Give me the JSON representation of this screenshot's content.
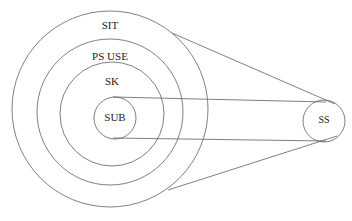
{
  "diagram": {
    "background_color": "#ffffff",
    "stroke_color": "#5f5f5f",
    "text_color": "#1a1a1a",
    "rings": [
      {
        "id": "sit",
        "label": "SIT",
        "cx": 110,
        "cy": 109,
        "r": 98,
        "label_x": 110,
        "label_y": 26
      },
      {
        "id": "ps-use",
        "label": "PS  USE",
        "cx": 110,
        "cy": 112,
        "r": 73,
        "label_x": 110,
        "label_y": 57
      },
      {
        "id": "sk",
        "label": "SK",
        "cx": 112,
        "cy": 114,
        "r": 52,
        "label_x": 112,
        "label_y": 82
      },
      {
        "id": "sub",
        "label": "SUB",
        "cx": 115,
        "cy": 118,
        "r": 21,
        "label_x": 115,
        "label_y": 118
      }
    ],
    "external_node": {
      "id": "ss",
      "label": "SS",
      "cx": 324,
      "cy": 121,
      "r": 21,
      "label_x": 324,
      "label_y": 121
    },
    "connectors": [
      {
        "id": "outer-upper-tangent",
        "from": "sit",
        "to": "ss",
        "x1": 172,
        "y1": 33,
        "x2": 335,
        "y2": 104
      },
      {
        "id": "outer-lower-tangent",
        "from": "sit",
        "to": "ss",
        "x1": 168,
        "y1": 190,
        "x2": 337,
        "y2": 136
      },
      {
        "id": "inner-upper-tangent",
        "from": "sub",
        "to": "ss",
        "x1": 113,
        "y1": 97,
        "x2": 324,
        "y2": 102
      },
      {
        "id": "inner-lower-tangent",
        "from": "sub",
        "to": "ss",
        "x1": 113,
        "y1": 138,
        "x2": 324,
        "y2": 141
      }
    ]
  }
}
